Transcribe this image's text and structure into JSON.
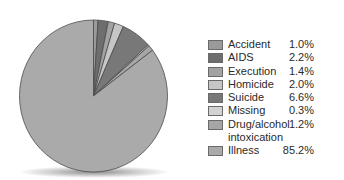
{
  "chart_data": {
    "type": "pie",
    "title": "",
    "categories": [
      "Accident",
      "AIDS",
      "Execution",
      "Homicide",
      "Suicide",
      "Missing",
      "Drug/alcohol intoxication",
      "Illness"
    ],
    "values": [
      1.0,
      2.2,
      1.4,
      2.0,
      6.6,
      0.3,
      1.2,
      85.2
    ],
    "value_labels": [
      "1.0%",
      "2.2%",
      "1.4%",
      "2.0%",
      "6.6%",
      "0.3%",
      "1.2%",
      "85.2%"
    ],
    "colors": [
      "#9a9a9a",
      "#6e6e6e",
      "#a2a2a2",
      "#c6c6c6",
      "#787878",
      "#d2d2d2",
      "#a6a6a6",
      "#aaaaaa"
    ],
    "start_angle_deg": 0,
    "direction": "clockwise",
    "legend_position": "right"
  },
  "legend": {
    "items": [
      {
        "label": "Accident",
        "value": "1.0%"
      },
      {
        "label": "AIDS",
        "value": "2.2%"
      },
      {
        "label": "Execution",
        "value": "1.4%"
      },
      {
        "label": "Homicide",
        "value": "2.0%"
      },
      {
        "label": "Suicide",
        "value": "6.6%"
      },
      {
        "label": "Missing",
        "value": "0.3%"
      },
      {
        "label": "Drug/alcohol intoxication",
        "value": "1.2%"
      },
      {
        "label": "Illness",
        "value": "85.2%"
      }
    ]
  }
}
